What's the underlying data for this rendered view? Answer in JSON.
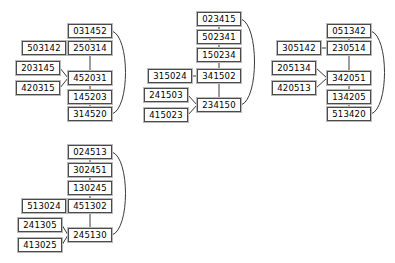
{
  "diagram": {
    "type": "node-link-graph",
    "background_color": "#ffffff",
    "node_border_color": "#4a4a4a",
    "node_shadow_color": "#b9b9b9",
    "edge_color": "#3a3a3a",
    "node_width": 44,
    "node_height": 14,
    "clusters": [
      {
        "id": "cluster-1",
        "nodes": [
          {
            "id": "c1n0",
            "label": "031452",
            "x": 68,
            "y": 24
          },
          {
            "id": "c1n1",
            "label": "503142",
            "x": 22,
            "y": 41
          },
          {
            "id": "c1n2",
            "label": "250314",
            "x": 68,
            "y": 41
          },
          {
            "id": "c1n3",
            "label": "203145",
            "x": 16,
            "y": 61
          },
          {
            "id": "c1n4",
            "label": "452031",
            "x": 68,
            "y": 71
          },
          {
            "id": "c1n5",
            "label": "420315",
            "x": 16,
            "y": 81
          },
          {
            "id": "c1n6",
            "label": "145203",
            "x": 68,
            "y": 90
          },
          {
            "id": "c1n7",
            "label": "314520",
            "x": 68,
            "y": 107
          }
        ],
        "edges": [
          {
            "from": "c1n0",
            "to": "c1n2",
            "kind": "straight"
          },
          {
            "from": "c1n1",
            "to": "c1n2",
            "kind": "straight"
          },
          {
            "from": "c1n2",
            "to": "c1n4",
            "kind": "straight"
          },
          {
            "from": "c1n3",
            "to": "c1n4",
            "kind": "straight"
          },
          {
            "from": "c1n5",
            "to": "c1n4",
            "kind": "straight"
          },
          {
            "from": "c1n4",
            "to": "c1n6",
            "kind": "straight"
          },
          {
            "from": "c1n6",
            "to": "c1n7",
            "kind": "straight"
          },
          {
            "from": "c1n0",
            "to": "c1n7",
            "kind": "curved-right"
          }
        ]
      },
      {
        "id": "cluster-2",
        "nodes": [
          {
            "id": "c2n0",
            "label": "023415",
            "x": 197,
            "y": 12
          },
          {
            "id": "c2n1",
            "label": "502341",
            "x": 197,
            "y": 30
          },
          {
            "id": "c2n2",
            "label": "150234",
            "x": 197,
            "y": 48
          },
          {
            "id": "c2n3",
            "label": "315024",
            "x": 148,
            "y": 69
          },
          {
            "id": "c2n4",
            "label": "341502",
            "x": 197,
            "y": 69
          },
          {
            "id": "c2n5",
            "label": "241503",
            "x": 144,
            "y": 88
          },
          {
            "id": "c2n6",
            "label": "234150",
            "x": 197,
            "y": 98
          },
          {
            "id": "c2n7",
            "label": "415023",
            "x": 144,
            "y": 108
          }
        ],
        "edges": [
          {
            "from": "c2n0",
            "to": "c2n1",
            "kind": "straight"
          },
          {
            "from": "c2n1",
            "to": "c2n2",
            "kind": "straight"
          },
          {
            "from": "c2n2",
            "to": "c2n4",
            "kind": "straight"
          },
          {
            "from": "c2n3",
            "to": "c2n4",
            "kind": "straight"
          },
          {
            "from": "c2n4",
            "to": "c2n6",
            "kind": "straight"
          },
          {
            "from": "c2n5",
            "to": "c2n6",
            "kind": "straight"
          },
          {
            "from": "c2n7",
            "to": "c2n6",
            "kind": "straight"
          },
          {
            "from": "c2n0",
            "to": "c2n6",
            "kind": "curved-right"
          }
        ]
      },
      {
        "id": "cluster-3",
        "nodes": [
          {
            "id": "c3n0",
            "label": "051342",
            "x": 327,
            "y": 24
          },
          {
            "id": "c3n1",
            "label": "305142",
            "x": 277,
            "y": 41
          },
          {
            "id": "c3n2",
            "label": "230514",
            "x": 327,
            "y": 41
          },
          {
            "id": "c3n3",
            "label": "205134",
            "x": 272,
            "y": 61
          },
          {
            "id": "c3n4",
            "label": "342051",
            "x": 327,
            "y": 71
          },
          {
            "id": "c3n5",
            "label": "420513",
            "x": 272,
            "y": 81
          },
          {
            "id": "c3n6",
            "label": "134205",
            "x": 327,
            "y": 90
          },
          {
            "id": "c3n7",
            "label": "513420",
            "x": 327,
            "y": 107
          }
        ],
        "edges": [
          {
            "from": "c3n0",
            "to": "c3n2",
            "kind": "straight"
          },
          {
            "from": "c3n1",
            "to": "c3n2",
            "kind": "straight"
          },
          {
            "from": "c3n2",
            "to": "c3n4",
            "kind": "straight"
          },
          {
            "from": "c3n3",
            "to": "c3n4",
            "kind": "straight"
          },
          {
            "from": "c3n5",
            "to": "c3n4",
            "kind": "straight"
          },
          {
            "from": "c3n4",
            "to": "c3n6",
            "kind": "straight"
          },
          {
            "from": "c3n6",
            "to": "c3n7",
            "kind": "straight"
          },
          {
            "from": "c3n0",
            "to": "c3n7",
            "kind": "curved-right"
          }
        ]
      },
      {
        "id": "cluster-4",
        "nodes": [
          {
            "id": "c4n0",
            "label": "024513",
            "x": 68,
            "y": 145
          },
          {
            "id": "c4n1",
            "label": "302451",
            "x": 68,
            "y": 163
          },
          {
            "id": "c4n2",
            "label": "130245",
            "x": 68,
            "y": 181
          },
          {
            "id": "c4n3",
            "label": "513024",
            "x": 22,
            "y": 199
          },
          {
            "id": "c4n4",
            "label": "451302",
            "x": 68,
            "y": 199
          },
          {
            "id": "c4n5",
            "label": "241305",
            "x": 18,
            "y": 218
          },
          {
            "id": "c4n6",
            "label": "245130",
            "x": 68,
            "y": 228
          },
          {
            "id": "c4n7",
            "label": "413025",
            "x": 18,
            "y": 238
          }
        ],
        "edges": [
          {
            "from": "c4n0",
            "to": "c4n1",
            "kind": "straight"
          },
          {
            "from": "c4n1",
            "to": "c4n2",
            "kind": "straight"
          },
          {
            "from": "c4n2",
            "to": "c4n4",
            "kind": "straight"
          },
          {
            "from": "c4n3",
            "to": "c4n4",
            "kind": "straight"
          },
          {
            "from": "c4n4",
            "to": "c4n6",
            "kind": "straight"
          },
          {
            "from": "c4n5",
            "to": "c4n6",
            "kind": "straight"
          },
          {
            "from": "c4n7",
            "to": "c4n6",
            "kind": "straight"
          },
          {
            "from": "c4n0",
            "to": "c4n6",
            "kind": "curved-right"
          }
        ]
      }
    ]
  }
}
